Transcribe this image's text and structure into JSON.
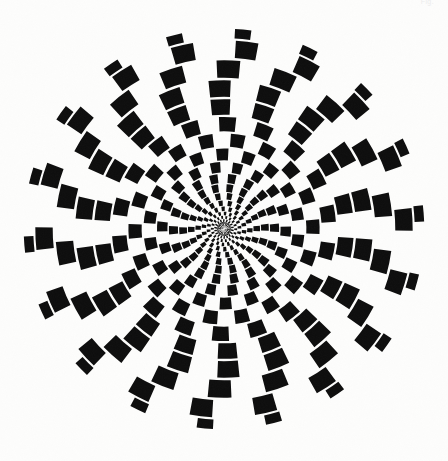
{
  "document": {
    "kind": "op-art-figure",
    "title": "Radial spiral checkerboard",
    "canvas_width": 448,
    "canvas_height": 461,
    "background_color": "#fdfdfc",
    "ink_color": "#0d0d0d"
  },
  "corner_mark": {
    "text": "Fig.",
    "color": "#ececec",
    "position": "top-right",
    "clipped": true
  },
  "figure": {
    "name": "spiral-checkerboard",
    "center_x": 224,
    "center_y": 229,
    "radius": 201,
    "sectors": 36,
    "rings": 19,
    "inner_radius": 3.2,
    "twist_turns": 0.78,
    "cell_gap_angular": 0.11,
    "cell_gap_radial": 0.13,
    "fill_color": "#0d0d0d",
    "gap_color": "#fdfdfc",
    "ring_radii": [
      3.2,
      5.0,
      7.2,
      10.0,
      13.4,
      17.6,
      22.8,
      29.0,
      36.5,
      45.4,
      55.8,
      67.8,
      81.4,
      96.6,
      113.2,
      131.0,
      150.0,
      170.0,
      190.0,
      201.0
    ],
    "ring_squash": [
      1.0,
      1.0,
      1.0,
      1.0,
      1.0,
      1.0,
      1.0,
      1.0,
      1.0,
      1.0,
      1.0,
      1.0,
      1.0,
      1.0,
      0.99,
      0.97,
      0.92,
      0.8,
      0.58,
      0.3
    ],
    "parity_offset": 0
  }
}
